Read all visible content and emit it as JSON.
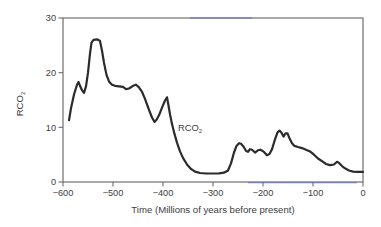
{
  "chart_data": {
    "type": "line",
    "title": "",
    "xlabel": "Time (Millions of years before present)",
    "ylabel_main": "RCO",
    "ylabel_sub": "2",
    "xlim": [
      -600,
      0
    ],
    "ylim": [
      0,
      30
    ],
    "grid": false,
    "legend": "none",
    "x_ticks": [
      {
        "v": -600,
        "label": "−600"
      },
      {
        "v": -500,
        "label": "−500"
      },
      {
        "v": -400,
        "label": "−400"
      },
      {
        "v": -300,
        "label": "−300"
      },
      {
        "v": -200,
        "label": "−200"
      },
      {
        "v": -100,
        "label": "−100"
      },
      {
        "v": 0,
        "label": "0"
      }
    ],
    "y_ticks": [
      {
        "v": 0,
        "label": "0"
      },
      {
        "v": 10,
        "label": "10"
      },
      {
        "v": 20,
        "label": "20"
      },
      {
        "v": 30,
        "label": "30"
      }
    ],
    "annotation": {
      "text_main": "RCO",
      "text_sub": "2",
      "t": -370,
      "v": 9.3
    },
    "series": [
      {
        "name": "RCO2",
        "points": [
          [
            -588,
            11.3
          ],
          [
            -584,
            13.5
          ],
          [
            -578,
            16.0
          ],
          [
            -572,
            17.8
          ],
          [
            -569,
            18.3
          ],
          [
            -566,
            17.6
          ],
          [
            -562,
            16.8
          ],
          [
            -558,
            16.3
          ],
          [
            -554,
            17.5
          ],
          [
            -550,
            20.0
          ],
          [
            -546,
            23.5
          ],
          [
            -543,
            25.5
          ],
          [
            -539,
            26.0
          ],
          [
            -531,
            26.1
          ],
          [
            -526,
            25.8
          ],
          [
            -522,
            24.0
          ],
          [
            -518,
            21.8
          ],
          [
            -513,
            19.6
          ],
          [
            -508,
            18.4
          ],
          [
            -502,
            17.8
          ],
          [
            -496,
            17.6
          ],
          [
            -488,
            17.5
          ],
          [
            -480,
            17.4
          ],
          [
            -474,
            17.0
          ],
          [
            -468,
            17.1
          ],
          [
            -460,
            17.6
          ],
          [
            -454,
            17.8
          ],
          [
            -448,
            17.3
          ],
          [
            -442,
            16.5
          ],
          [
            -436,
            15.2
          ],
          [
            -428,
            13.2
          ],
          [
            -422,
            11.8
          ],
          [
            -417,
            11.0
          ],
          [
            -413,
            11.4
          ],
          [
            -408,
            12.2
          ],
          [
            -402,
            13.6
          ],
          [
            -396,
            14.9
          ],
          [
            -392,
            15.5
          ],
          [
            -389,
            14.0
          ],
          [
            -386,
            12.4
          ],
          [
            -382,
            10.6
          ],
          [
            -377,
            8.8
          ],
          [
            -372,
            7.2
          ],
          [
            -366,
            5.6
          ],
          [
            -360,
            4.4
          ],
          [
            -352,
            3.2
          ],
          [
            -344,
            2.4
          ],
          [
            -336,
            1.9
          ],
          [
            -326,
            1.65
          ],
          [
            -314,
            1.55
          ],
          [
            -300,
            1.55
          ],
          [
            -288,
            1.6
          ],
          [
            -278,
            1.7
          ],
          [
            -270,
            2.1
          ],
          [
            -264,
            3.4
          ],
          [
            -258,
            5.4
          ],
          [
            -253,
            6.6
          ],
          [
            -248,
            7.1
          ],
          [
            -244,
            7.0
          ],
          [
            -240,
            6.6
          ],
          [
            -234,
            5.7
          ],
          [
            -230,
            5.5
          ],
          [
            -226,
            6.0
          ],
          [
            -222,
            5.9
          ],
          [
            -216,
            5.4
          ],
          [
            -210,
            5.8
          ],
          [
            -205,
            5.9
          ],
          [
            -198,
            5.5
          ],
          [
            -192,
            4.9
          ],
          [
            -187,
            5.1
          ],
          [
            -182,
            6.0
          ],
          [
            -176,
            7.8
          ],
          [
            -171,
            9.1
          ],
          [
            -167,
            9.4
          ],
          [
            -163,
            9.0
          ],
          [
            -159,
            8.3
          ],
          [
            -155,
            8.9
          ],
          [
            -151,
            8.9
          ],
          [
            -147,
            8.0
          ],
          [
            -142,
            7.1
          ],
          [
            -137,
            6.6
          ],
          [
            -130,
            6.4
          ],
          [
            -122,
            6.2
          ],
          [
            -114,
            5.9
          ],
          [
            -106,
            5.6
          ],
          [
            -98,
            5.0
          ],
          [
            -90,
            4.3
          ],
          [
            -82,
            3.8
          ],
          [
            -74,
            3.3
          ],
          [
            -66,
            3.1
          ],
          [
            -58,
            3.2
          ],
          [
            -52,
            3.7
          ],
          [
            -48,
            3.5
          ],
          [
            -42,
            2.9
          ],
          [
            -36,
            2.5
          ],
          [
            -28,
            2.1
          ],
          [
            -20,
            1.9
          ],
          [
            -10,
            1.85
          ],
          [
            0,
            1.85
          ]
        ]
      }
    ],
    "colors": {
      "curve": "#2b2b2b",
      "axis": "#6e6e6e",
      "text": "#3d3d3d",
      "scan_artifact_blue": "#5c5cd9"
    },
    "scan_artifacts": {
      "top_blue_segment_x": [
        190,
        252
      ],
      "bottom_blue_segment_x": [
        248,
        357
      ]
    }
  }
}
